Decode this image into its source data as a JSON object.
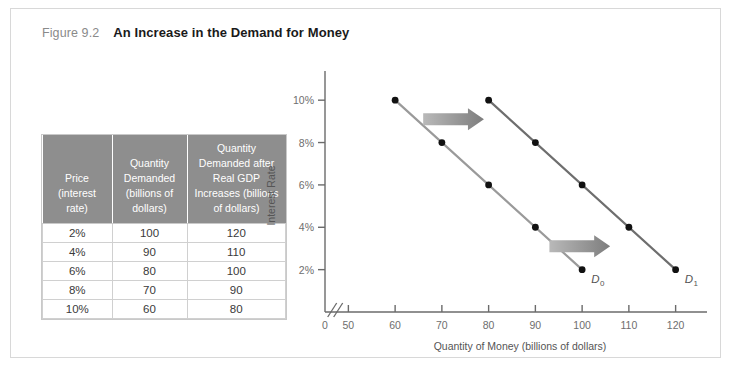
{
  "figure": {
    "number": "Figure 9.2",
    "title": "An Increase in the Demand for Money"
  },
  "table": {
    "headers": [
      "Price (interest rate)",
      "Quantity Demanded (billions of dollars)",
      "Quantity Demanded after Real GDP Increases (billions of dollars)"
    ],
    "header_lines": {
      "c0": [
        "Price",
        "(interest",
        "rate)"
      ],
      "c1": [
        "Quantity",
        "Demanded",
        "(billions of",
        "dollars)"
      ],
      "c2": [
        "Quantity",
        "Demanded after",
        "Real GDP",
        "Increases (billions",
        "of dollars)"
      ]
    },
    "rows": [
      [
        "2%",
        "100",
        "120"
      ],
      [
        "4%",
        "90",
        "110"
      ],
      [
        "6%",
        "80",
        "100"
      ],
      [
        "8%",
        "70",
        "90"
      ],
      [
        "10%",
        "60",
        "80"
      ]
    ]
  },
  "chart_data": {
    "type": "line",
    "title": "",
    "xlabel": "Quantity of Money (billions of dollars)",
    "ylabel": "Interest Rate",
    "xticks": [
      0,
      50,
      60,
      70,
      80,
      90,
      100,
      110,
      120
    ],
    "xtick_labels": [
      "0",
      "50",
      "60",
      "70",
      "80",
      "90",
      "100",
      "110",
      "120"
    ],
    "yticks": [
      2,
      4,
      6,
      8,
      10
    ],
    "ytick_labels": [
      "2%",
      "4%",
      "6%",
      "8%",
      "10%"
    ],
    "xlim": [
      50,
      125
    ],
    "ylim": [
      0,
      11
    ],
    "axis_break": true,
    "grid": false,
    "legend": "none",
    "series": [
      {
        "name": "D0",
        "label": "D",
        "label_sub": "0",
        "color": "#9a9a9a",
        "x": [
          60,
          70,
          80,
          90,
          100
        ],
        "y": [
          10,
          8,
          6,
          4,
          2
        ]
      },
      {
        "name": "D1",
        "label": "D",
        "label_sub": "1",
        "color": "#6e6e6e",
        "x": [
          80,
          90,
          100,
          110,
          120
        ],
        "y": [
          10,
          8,
          6,
          4,
          2
        ]
      }
    ],
    "annotations": [
      {
        "name": "shift-arrow-upper",
        "direction": "right",
        "x_from": 66,
        "x_to": 79,
        "y": 9.1
      },
      {
        "name": "shift-arrow-lower",
        "direction": "right",
        "x_from": 93,
        "x_to": 106,
        "y": 3.1
      }
    ],
    "marker_color": "#111111"
  }
}
